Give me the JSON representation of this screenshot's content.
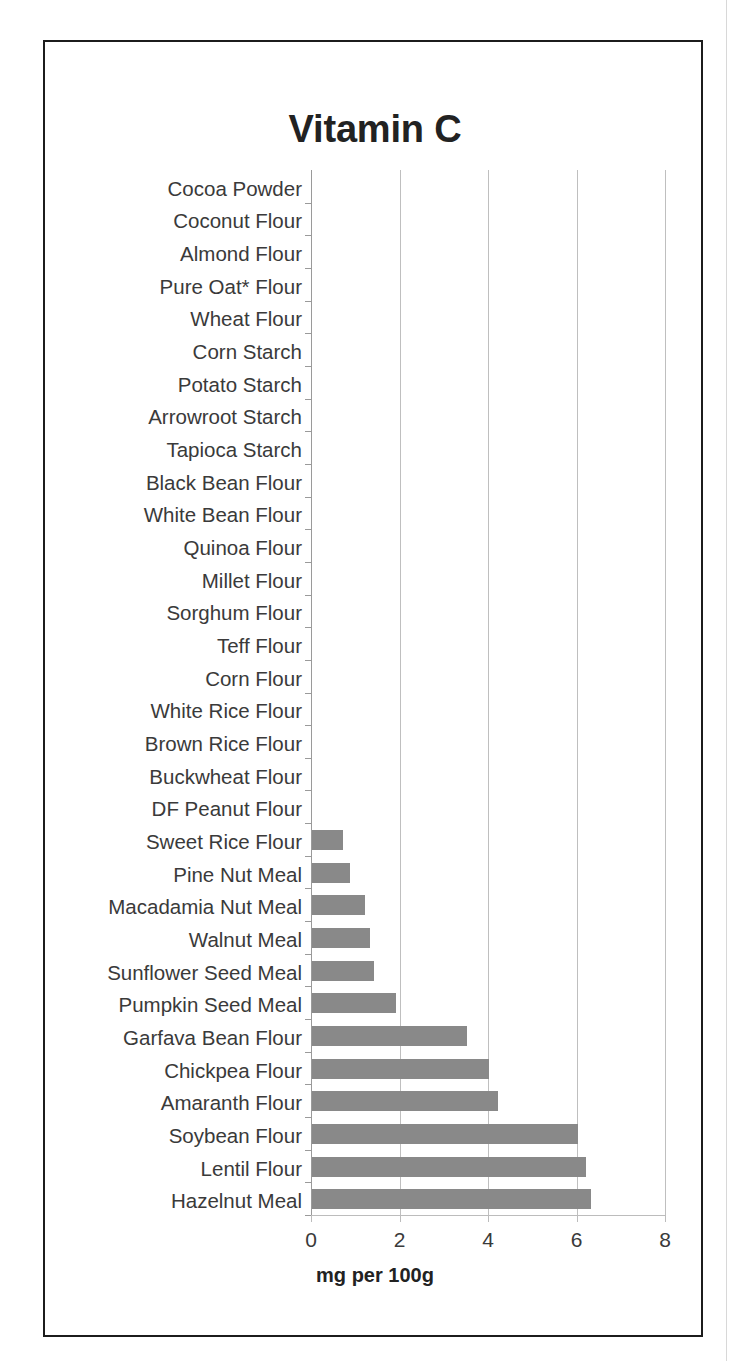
{
  "chart_data": {
    "type": "bar",
    "orientation": "horizontal",
    "title": "Vitamin C",
    "xlabel": "mg per 100g",
    "ylabel": "",
    "xlim": [
      0,
      8
    ],
    "xticks": [
      "0",
      "2",
      "4",
      "6",
      "8"
    ],
    "grid": "vertical-major",
    "legend": "none",
    "bar_color": "#898989",
    "categories": [
      "Cocoa Powder",
      "Coconut Flour",
      "Almond Flour",
      "Pure Oat* Flour",
      "Wheat Flour",
      "Corn Starch",
      "Potato Starch",
      "Arrowroot Starch",
      "Tapioca Starch",
      "Black Bean Flour",
      "White Bean Flour",
      "Quinoa Flour",
      "Millet Flour",
      "Sorghum Flour",
      "Teff Flour",
      "Corn Flour",
      "White Rice Flour",
      "Brown Rice Flour",
      "Buckwheat Flour",
      "DF Peanut Flour",
      "Sweet Rice Flour",
      "Pine Nut Meal",
      "Macadamia Nut Meal",
      "Walnut Meal",
      "Sunflower Seed Meal",
      "Pumpkin Seed Meal",
      "Garfava Bean Flour",
      "Chickpea Flour",
      "Amaranth Flour",
      "Soybean Flour",
      "Lentil Flour",
      "Hazelnut Meal"
    ],
    "values": [
      0,
      0,
      0,
      0,
      0,
      0,
      0,
      0,
      0,
      0,
      0,
      0,
      0,
      0,
      0,
      0,
      0,
      0,
      0,
      0,
      0.7,
      0.85,
      1.2,
      1.3,
      1.4,
      1.9,
      3.5,
      4.0,
      4.2,
      6.0,
      6.2,
      6.3
    ]
  }
}
